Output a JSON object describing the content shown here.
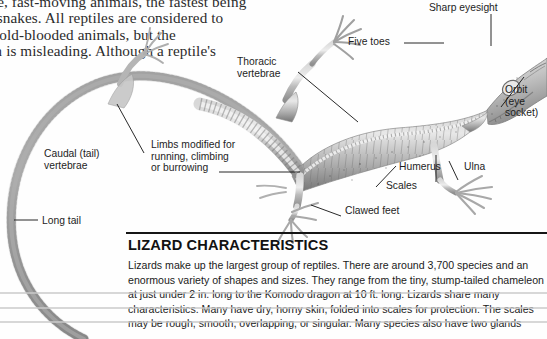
{
  "page": {
    "width": 547,
    "height": 339,
    "background": "#fefefe",
    "ink": "#1b1b1b"
  },
  "body_copy": {
    "lines": [
      "agile, fast-moving animals, the fastest being",
      "the snakes. All reptiles are considered to",
      "be cold-blooded animals, but the",
      "term is misleading. Although a reptile's"
    ]
  },
  "figure": {
    "name": "lizard-skeleton",
    "callouts": [
      {
        "id": "sharp-eyesight",
        "text": "Sharp eyesight"
      },
      {
        "id": "five-toes",
        "text": "Five toes"
      },
      {
        "id": "thoracic",
        "text": "Thoracic\nvertebrae"
      },
      {
        "id": "orbit",
        "text": "Orbit\n(eye\nsocket)"
      },
      {
        "id": "humerus",
        "text": "Humerus"
      },
      {
        "id": "ulna",
        "text": "Ulna"
      },
      {
        "id": "caudal",
        "text": "Caudal (tail)\nvertebrae"
      },
      {
        "id": "limbs",
        "text": "Limbs modified for\nrunning, climbing\nor burrowing"
      },
      {
        "id": "scales",
        "text": "Scales"
      },
      {
        "id": "clawed-feet",
        "text": "Clawed feet"
      },
      {
        "id": "long-tail",
        "text": "Long tail"
      }
    ]
  },
  "article": {
    "title": "LIZARD CHARACTERISTICS",
    "paragraph_lines": [
      "Lizards make up the largest group of reptiles. There are around 3,700 species and an",
      "enormous variety of shapes and sizes. They range from the tiny, stump-tailed chameleon",
      "at just under 2 in. long to the Komodo dragon at 10 ft. long. Lizards share many",
      "characteristics. Many have dry, horny skin, folded into scales for protection. The scales",
      "may be rough, smooth, overlapping, or singular. Many species also have two glands"
    ]
  }
}
